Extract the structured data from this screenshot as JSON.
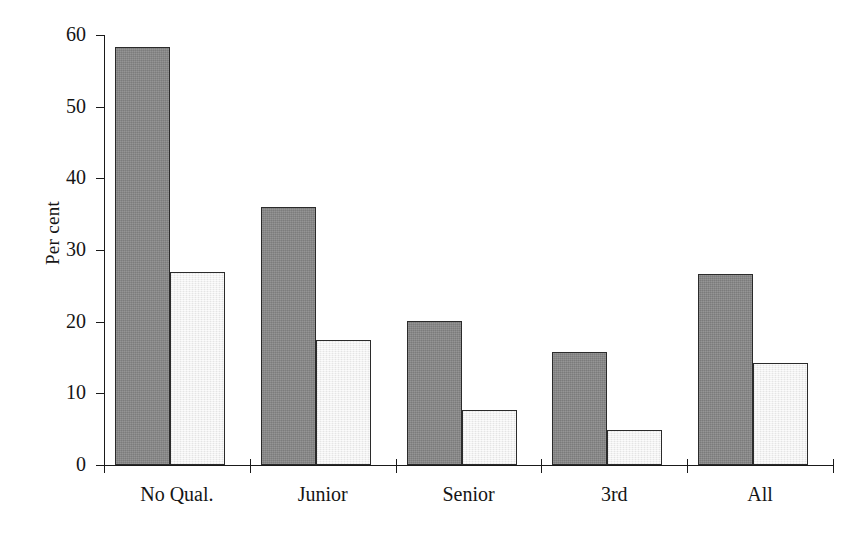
{
  "chart_data": {
    "type": "bar",
    "title": "",
    "xlabel": "",
    "ylabel": "Per cent",
    "ylim": [
      0,
      60
    ],
    "yticks": [
      0,
      10,
      20,
      30,
      40,
      50,
      60
    ],
    "ytick_labels": [
      "0",
      "10",
      "20",
      "30",
      "40",
      "50",
      "60"
    ],
    "grid": false,
    "legend": "none",
    "categories": [
      "No Qual.",
      "Junior",
      "Senior",
      "3rd",
      "All"
    ],
    "series": [
      {
        "name": "series-a",
        "color": "#888888",
        "values": [
          58.3,
          36.0,
          20.1,
          15.8,
          26.7
        ]
      },
      {
        "name": "series-b",
        "color": "#efefef",
        "values": [
          27.0,
          17.4,
          7.7,
          4.9,
          14.2
        ]
      }
    ]
  },
  "axis": {
    "y_title": "Per cent",
    "tick_color": "#1a1a1a"
  }
}
